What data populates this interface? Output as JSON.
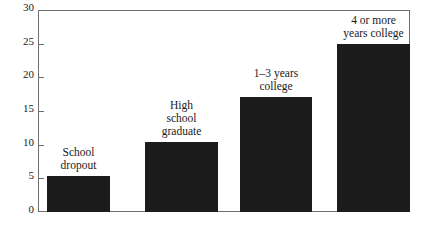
{
  "chart_data": {
    "type": "bar",
    "title": "",
    "subtitle": "",
    "xlabel": "",
    "ylabel": "",
    "ylim": [
      0,
      30
    ],
    "yticks": [
      0,
      5,
      10,
      15,
      20,
      25,
      30
    ],
    "ytick_labels": [
      "0",
      "5",
      "10",
      "15",
      "20",
      "25",
      "30"
    ],
    "grid": false,
    "legend": false,
    "categories": [
      "School\ndropout",
      "High\nschool\ngraduate",
      "1–3 years\ncollege",
      "4 or more\nyears college"
    ],
    "values": [
      5.3,
      10.4,
      17.1,
      25.0
    ],
    "bar_color": "#1c1c1c",
    "frame_color": "#6e6e6e",
    "background_color": "#ffffff"
  },
  "axis": {
    "y_tick_0": "0",
    "y_tick_1": "5",
    "y_tick_2": "10",
    "y_tick_3": "15",
    "y_tick_4": "20",
    "y_tick_5": "25",
    "y_tick_6": "30"
  },
  "bars": {
    "bar_0_label": "School\ndropout",
    "bar_1_label": "High\nschool\ngraduate",
    "bar_2_label": "1–3 years\ncollege",
    "bar_3_label": "4 or more\nyears college"
  }
}
